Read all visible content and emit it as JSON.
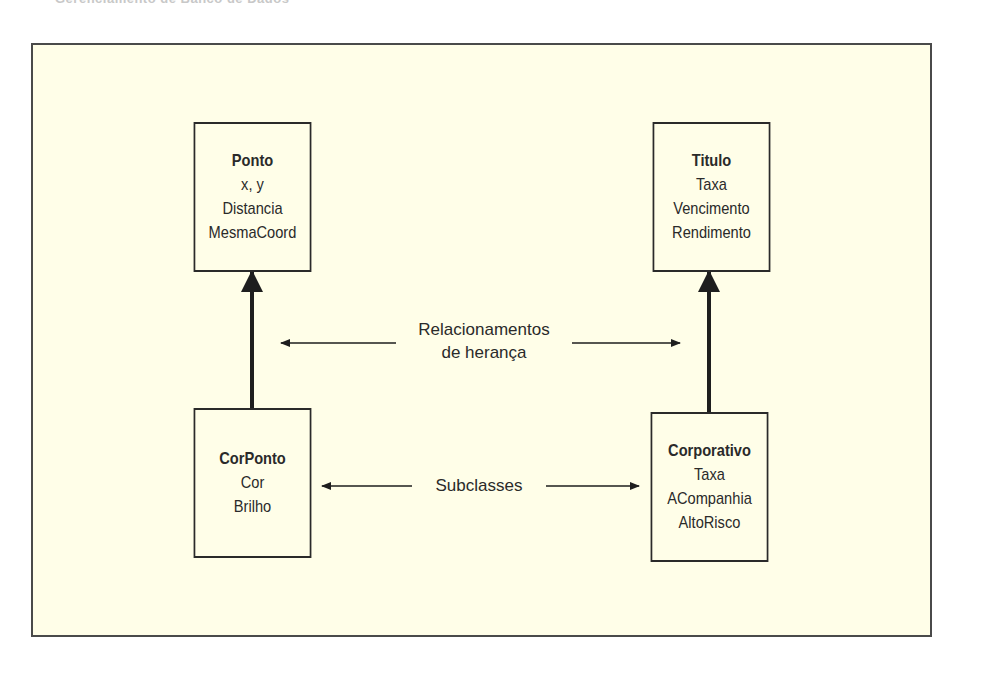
{
  "header": {
    "cut_text": "Gerenciamento de Banco de Dados"
  },
  "diagram": {
    "classes": {
      "ponto": {
        "name": "Ponto",
        "attrs": [
          "x, y",
          "Distancia",
          "MesmaCoord"
        ]
      },
      "titulo": {
        "name": "Titulo",
        "attrs": [
          "Taxa",
          "Vencimento",
          "Rendimento"
        ]
      },
      "corponto": {
        "name": "CorPonto",
        "attrs": [
          "Cor",
          "Brilho"
        ]
      },
      "corporativo": {
        "name": "Corporativo",
        "attrs": [
          "Taxa",
          "ACompanhia",
          "AltoRisco"
        ]
      }
    },
    "labels": {
      "inheritance_line1": "Relacionamentos",
      "inheritance_line2": "de herança",
      "subclasses": "Subclasses"
    },
    "relationships": [
      {
        "from": "CorPonto",
        "to": "Ponto",
        "type": "inherits"
      },
      {
        "from": "Corporativo",
        "to": "Titulo",
        "type": "inherits"
      }
    ],
    "colors": {
      "background": "#fffee8",
      "ink": "#2a2a2a",
      "frame": "#4a4a4a"
    }
  }
}
